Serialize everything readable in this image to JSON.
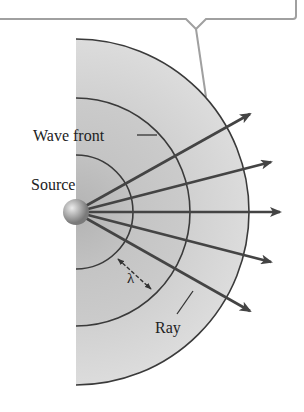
{
  "figure": {
    "type": "wave-front-diagram",
    "labels": {
      "wave_front": "Wave front",
      "source": "Source",
      "wavelength": "λ",
      "ray": "Ray"
    },
    "callout": {
      "text": ""
    },
    "geometry": {
      "source_center": [
        76,
        212
      ],
      "source_radius": 13,
      "wavefront_radii": [
        57,
        114,
        173
      ],
      "ray_count": 5
    },
    "colors": {
      "shade_outer": "#d6d6d6",
      "shade_mid": "#c8c8c8",
      "shade_inner": "#bdbdbd",
      "line": "#3a3a3a",
      "arrow": "#444444",
      "callout_border": "#9a9a9a"
    }
  }
}
